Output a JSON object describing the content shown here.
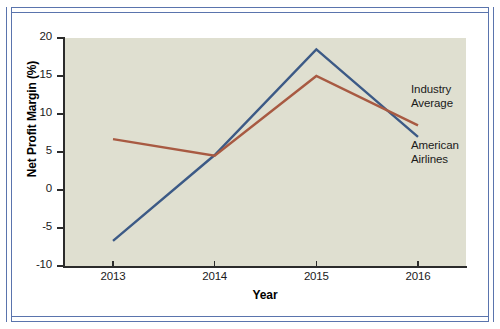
{
  "chart_data": {
    "type": "line",
    "title": "",
    "xlabel": "Year",
    "ylabel": "Net Profit Margin (%)",
    "categories": [
      "2013",
      "2014",
      "2015",
      "2016"
    ],
    "x": [
      2013,
      2014,
      2015,
      2016
    ],
    "xlim": [
      2013,
      2016
    ],
    "ylim": [
      -10,
      20
    ],
    "yticks": [
      -10,
      -5,
      0,
      5,
      10,
      15,
      20
    ],
    "ytick_labels": [
      "-10",
      "-5",
      "0",
      "5",
      "10",
      "15",
      "20"
    ],
    "xticks": [
      2013,
      2014,
      2015,
      2016
    ],
    "xtick_labels": [
      "2013",
      "2014",
      "2015",
      "2016"
    ],
    "grid": false,
    "legend_position": "inline-annotations-right",
    "plot_background": "#dfdfd0",
    "series": [
      {
        "name": "American Airlines",
        "color": "#3c5a86",
        "values": [
          -6.7,
          4.6,
          18.5,
          7.0
        ]
      },
      {
        "name": "Industry Average",
        "color": "#a85a42",
        "values": [
          6.7,
          4.5,
          15.0,
          8.5
        ]
      }
    ],
    "annotations": [
      {
        "label": "Industry\nAverage",
        "series": "Industry Average"
      },
      {
        "label": "American\nAirlines",
        "series": "American Airlines"
      }
    ]
  },
  "figure": {
    "frame_color": "#5a74ad",
    "axis_color": "#2b2b2b"
  }
}
